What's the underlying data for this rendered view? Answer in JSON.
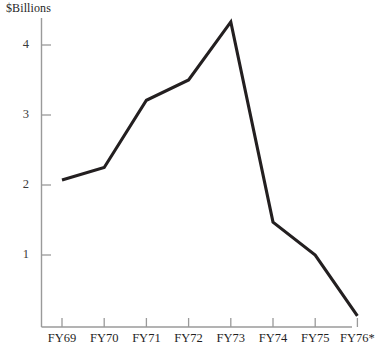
{
  "chart_data": {
    "type": "line",
    "title": "",
    "ylabel": "$Billions",
    "xlabel": "",
    "categories": [
      "FY69",
      "FY70",
      "FY71",
      "FY72",
      "FY73",
      "FY74",
      "FY75",
      "FY76*"
    ],
    "values": [
      2.07,
      2.25,
      3.21,
      3.5,
      4.33,
      1.47,
      1.0,
      0.13
    ],
    "ylim": [
      0,
      4.65
    ],
    "yticks": [
      1,
      2,
      3,
      4
    ],
    "ytick_labels": [
      "1",
      "2",
      "3",
      "4"
    ],
    "grid": false,
    "legend": null,
    "series": [
      {
        "name": "$Billions",
        "values": [
          2.07,
          2.25,
          3.21,
          3.5,
          4.33,
          1.47,
          1.0,
          0.13
        ],
        "color": "#231f20"
      }
    ],
    "annotations": [
      "FY76* denotes an estimated or partial fiscal year"
    ]
  },
  "colors": {
    "line": "#231f20",
    "axis": "#9a9a9a",
    "tick": "#9a9a9a",
    "label": "#1f1f1f",
    "background": "#ffffff"
  }
}
